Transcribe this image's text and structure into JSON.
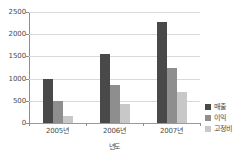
{
  "chart_data": {
    "type": "bar",
    "title": "",
    "subtitle": "",
    "xlabel": "년도",
    "ylabel": "",
    "categories": [
      "2005년",
      "2006년",
      "2007년"
    ],
    "series": [
      {
        "name": "매출",
        "color": "#494949",
        "values": [
          1000,
          1550,
          2280
        ]
      },
      {
        "name": "이익",
        "color": "#8e8e8e",
        "values": [
          500,
          850,
          1250
        ]
      },
      {
        "name": "고정비",
        "color": "#c8c8c8",
        "values": [
          150,
          420,
          690
        ]
      }
    ],
    "ylim": [
      0,
      2500
    ],
    "ytick_labels": [
      "0",
      "500",
      "1000",
      "1500",
      "2000",
      "2500"
    ],
    "ytick_values": [
      0,
      500,
      1000,
      1500,
      2000,
      2500
    ],
    "grid": true,
    "legend_position": "right"
  },
  "axes": {
    "y_ticks": [
      {
        "label": "2500",
        "value": 2500
      },
      {
        "label": "2000",
        "value": 2000
      },
      {
        "label": "1500",
        "value": 1500
      },
      {
        "label": "1000",
        "value": 1000
      },
      {
        "label": "500",
        "value": 500
      },
      {
        "label": "0",
        "value": 0
      }
    ],
    "x_ticks": [
      {
        "label": "2005년"
      },
      {
        "label": "2006년"
      },
      {
        "label": "2007년"
      }
    ],
    "x_title": "년도"
  },
  "legend": {
    "items": [
      {
        "label": "매출",
        "color": "#494949"
      },
      {
        "label": "이익",
        "color": "#8e8e8e"
      },
      {
        "label": "고정비",
        "color": "#c8c8c8"
      }
    ]
  }
}
